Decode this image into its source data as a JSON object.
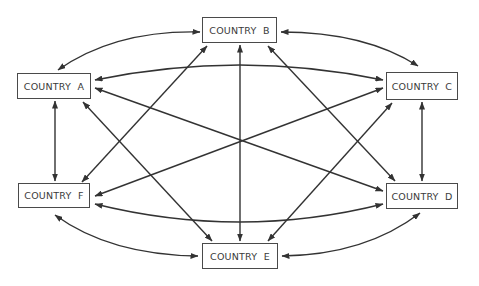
{
  "diagram": {
    "type": "network-complete-graph",
    "line_color": "#333333",
    "nodes": [
      {
        "id": "A",
        "label": "COUNTRY  A"
      },
      {
        "id": "B",
        "label": "COUNTRY  B"
      },
      {
        "id": "C",
        "label": "COUNTRY  C"
      },
      {
        "id": "D",
        "label": "COUNTRY  D"
      },
      {
        "id": "E",
        "label": "COUNTRY  E"
      },
      {
        "id": "F",
        "label": "COUNTRY  F"
      }
    ],
    "edges": [
      {
        "from": "A",
        "to": "B",
        "bidirectional": true
      },
      {
        "from": "A",
        "to": "C",
        "bidirectional": true
      },
      {
        "from": "A",
        "to": "D",
        "bidirectional": true
      },
      {
        "from": "A",
        "to": "E",
        "bidirectional": true
      },
      {
        "from": "A",
        "to": "F",
        "bidirectional": true
      },
      {
        "from": "B",
        "to": "C",
        "bidirectional": true
      },
      {
        "from": "B",
        "to": "D",
        "bidirectional": true
      },
      {
        "from": "B",
        "to": "E",
        "bidirectional": true
      },
      {
        "from": "B",
        "to": "F",
        "bidirectional": true
      },
      {
        "from": "C",
        "to": "D",
        "bidirectional": true
      },
      {
        "from": "C",
        "to": "E",
        "bidirectional": true
      },
      {
        "from": "C",
        "to": "F",
        "bidirectional": true
      },
      {
        "from": "D",
        "to": "E",
        "bidirectional": true
      },
      {
        "from": "D",
        "to": "F",
        "bidirectional": true
      },
      {
        "from": "E",
        "to": "F",
        "bidirectional": true
      }
    ]
  }
}
